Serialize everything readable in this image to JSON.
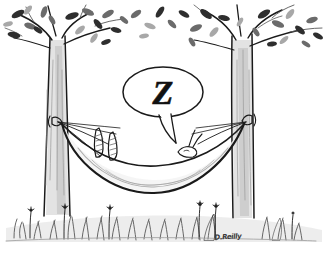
{
  "artwork": {
    "title": "Hammock Nap Cartoon",
    "medium": "pen-and-ink cartoon drawing",
    "background_color": "#ffffff",
    "ink_color": "#1a1a1a",
    "dimensions": {
      "width": 329,
      "height": 264
    }
  },
  "speech_bubble": {
    "text": "Z",
    "shape": "oval",
    "tail": "pointing down-left toward hammock",
    "fill_color": "#ffffff",
    "stroke_color": "#111111"
  },
  "scene": {
    "left_tree": {
      "label": "left tree",
      "type": "leafy deciduous tree"
    },
    "right_tree": {
      "label": "right tree",
      "type": "leafy deciduous tree"
    },
    "hammock": {
      "label": "hammock",
      "state": "occupied, sagging"
    },
    "sleeper": {
      "label": "rabbit sleeping in hammock",
      "visible_parts": "two feet and head with ears"
    },
    "ground": {
      "label": "grass and wildflowers"
    },
    "canopy": {
      "label": "leafy canopy of scattered leaves"
    }
  },
  "signature": {
    "text": "D.Reilly",
    "position": "bottom center-right"
  }
}
